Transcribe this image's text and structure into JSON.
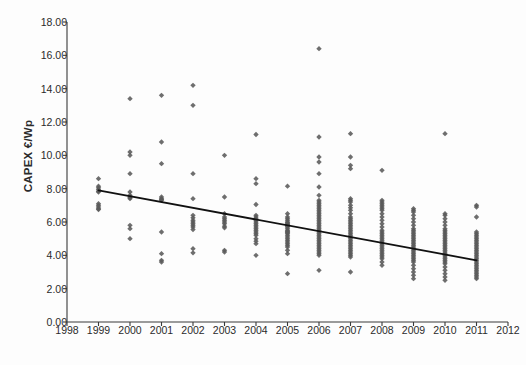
{
  "chart_data": {
    "type": "scatter",
    "title": "",
    "xlabel": "",
    "ylabel": "CAPEX €/Wp",
    "xlim": [
      1998,
      2012
    ],
    "ylim": [
      0.0,
      18.0
    ],
    "xticks": [
      1998,
      1999,
      2000,
      2001,
      2002,
      2003,
      2004,
      2005,
      2006,
      2007,
      2008,
      2009,
      2010,
      2011,
      2012
    ],
    "xtick_labels": [
      "1998",
      "1999",
      "2000",
      "2001",
      "2002",
      "2003",
      "2004",
      "2005",
      "2006",
      "2007",
      "2008",
      "2009",
      "2010",
      "2011",
      "2012"
    ],
    "yticks": [
      0.0,
      2.0,
      4.0,
      6.0,
      8.0,
      10.0,
      12.0,
      14.0,
      16.0,
      18.0
    ],
    "ytick_labels": [
      "0.00",
      "2.00",
      "4.00",
      "6.00",
      "8.00",
      "10.00",
      "12.00",
      "14.00",
      "16.00",
      "18.00"
    ],
    "grid": false,
    "legend": null,
    "marker": "diamond",
    "marker_color": "#5a5a5a",
    "axis_color": "#3a3a3a",
    "trendline": {
      "type": "linear",
      "color": "#111111",
      "x_start": 1999,
      "y_start": 7.9,
      "x_end": 2011,
      "y_end": 3.7
    },
    "series": [
      {
        "name": "CAPEX observations",
        "points_by_year": [
          {
            "year": 1999,
            "values": [
              8.6,
              8.15,
              8.05,
              7.95,
              7.85,
              7.8,
              7.1,
              7.0,
              6.9,
              6.8,
              6.75
            ]
          },
          {
            "year": 2000,
            "values": [
              13.4,
              10.2,
              10.0,
              8.9,
              7.8,
              7.6,
              7.5,
              7.45,
              7.4,
              5.8,
              5.6,
              5.0
            ]
          },
          {
            "year": 2001,
            "values": [
              13.6,
              10.8,
              9.5,
              7.5,
              7.4,
              7.35,
              7.3,
              5.4,
              4.1,
              3.7,
              3.6
            ]
          },
          {
            "year": 2002,
            "values": [
              14.2,
              13.0,
              8.9,
              7.4,
              6.4,
              6.25,
              6.1,
              6.0,
              5.9,
              5.8,
              5.7,
              5.55,
              4.4,
              4.15
            ]
          },
          {
            "year": 2003,
            "values": [
              10.0,
              7.5,
              6.5,
              6.3,
              6.2,
              6.1,
              6.0,
              5.9,
              5.75,
              5.65,
              4.3,
              4.2
            ]
          },
          {
            "year": 2004,
            "values": [
              11.25,
              8.6,
              8.3,
              7.05,
              6.4,
              6.3,
              6.2,
              6.1,
              6.0,
              5.9,
              5.8,
              5.7,
              5.6,
              5.5,
              5.4,
              5.3,
              5.2,
              5.0,
              4.85,
              4.7,
              4.0
            ]
          },
          {
            "year": 2005,
            "values": [
              8.15,
              6.5,
              6.3,
              6.2,
              6.1,
              6.0,
              5.95,
              5.9,
              5.85,
              5.8,
              5.75,
              5.7,
              5.6,
              5.5,
              5.45,
              5.4,
              5.35,
              5.3,
              5.2,
              5.1,
              5.0,
              4.9,
              4.8,
              4.7,
              4.6,
              4.5,
              4.3,
              4.1,
              2.9
            ]
          },
          {
            "year": 2006,
            "values": [
              16.4,
              11.1,
              9.9,
              9.6,
              8.9,
              8.1,
              7.6,
              7.3,
              7.2,
              7.1,
              7.0,
              6.9,
              6.8,
              6.7,
              6.6,
              6.5,
              6.4,
              6.3,
              6.2,
              6.1,
              6.0,
              5.9,
              5.8,
              5.7,
              5.6,
              5.5,
              5.4,
              5.3,
              5.2,
              5.1,
              5.0,
              4.9,
              4.8,
              4.7,
              4.6,
              4.5,
              4.4,
              4.3,
              4.2,
              4.1,
              4.0,
              3.1
            ]
          },
          {
            "year": 2007,
            "values": [
              11.3,
              9.9,
              9.4,
              9.2,
              7.4,
              7.3,
              7.2,
              7.0,
              6.85,
              6.7,
              6.5,
              6.3,
              6.2,
              6.1,
              6.0,
              5.9,
              5.8,
              5.7,
              5.6,
              5.5,
              5.4,
              5.3,
              5.2,
              5.1,
              5.0,
              4.9,
              4.8,
              4.7,
              4.6,
              4.5,
              4.4,
              4.3,
              4.2,
              4.1,
              4.0,
              3.9,
              3.0
            ]
          },
          {
            "year": 2008,
            "values": [
              9.1,
              7.3,
              7.2,
              7.1,
              7.0,
              6.9,
              6.8,
              6.7,
              6.5,
              6.3,
              6.1,
              5.9,
              5.7,
              5.5,
              5.4,
              5.3,
              5.2,
              5.1,
              5.0,
              4.9,
              4.8,
              4.7,
              4.6,
              4.5,
              4.4,
              4.3,
              4.2,
              4.1,
              4.0,
              3.9,
              3.8,
              3.6,
              3.4
            ]
          },
          {
            "year": 2009,
            "values": [
              6.8,
              6.7,
              6.6,
              6.4,
              6.2,
              6.0,
              5.8,
              5.6,
              5.5,
              5.4,
              5.3,
              5.2,
              5.1,
              5.0,
              4.9,
              4.8,
              4.7,
              4.6,
              4.5,
              4.4,
              4.3,
              4.2,
              4.1,
              4.0,
              3.9,
              3.8,
              3.7,
              3.6,
              3.4,
              3.2,
              3.0,
              2.8,
              2.6
            ]
          },
          {
            "year": 2010,
            "values": [
              11.3,
              6.5,
              6.4,
              6.2,
              6.0,
              5.8,
              5.6,
              5.5,
              5.4,
              5.3,
              5.2,
              5.1,
              5.0,
              4.9,
              4.8,
              4.7,
              4.6,
              4.5,
              4.4,
              4.3,
              4.2,
              4.1,
              4.0,
              3.9,
              3.8,
              3.7,
              3.6,
              3.5,
              3.3,
              3.1,
              2.9,
              2.7,
              2.5
            ]
          },
          {
            "year": 2011,
            "values": [
              7.0,
              6.9,
              6.3,
              5.4,
              5.3,
              5.2,
              5.1,
              5.0,
              4.9,
              4.8,
              4.7,
              4.6,
              4.5,
              4.4,
              4.3,
              4.2,
              4.1,
              4.0,
              3.9,
              3.8,
              3.7,
              3.6,
              3.5,
              3.4,
              3.3,
              3.2,
              3.1,
              3.0,
              2.9,
              2.8,
              2.7,
              2.6
            ]
          }
        ]
      }
    ]
  }
}
